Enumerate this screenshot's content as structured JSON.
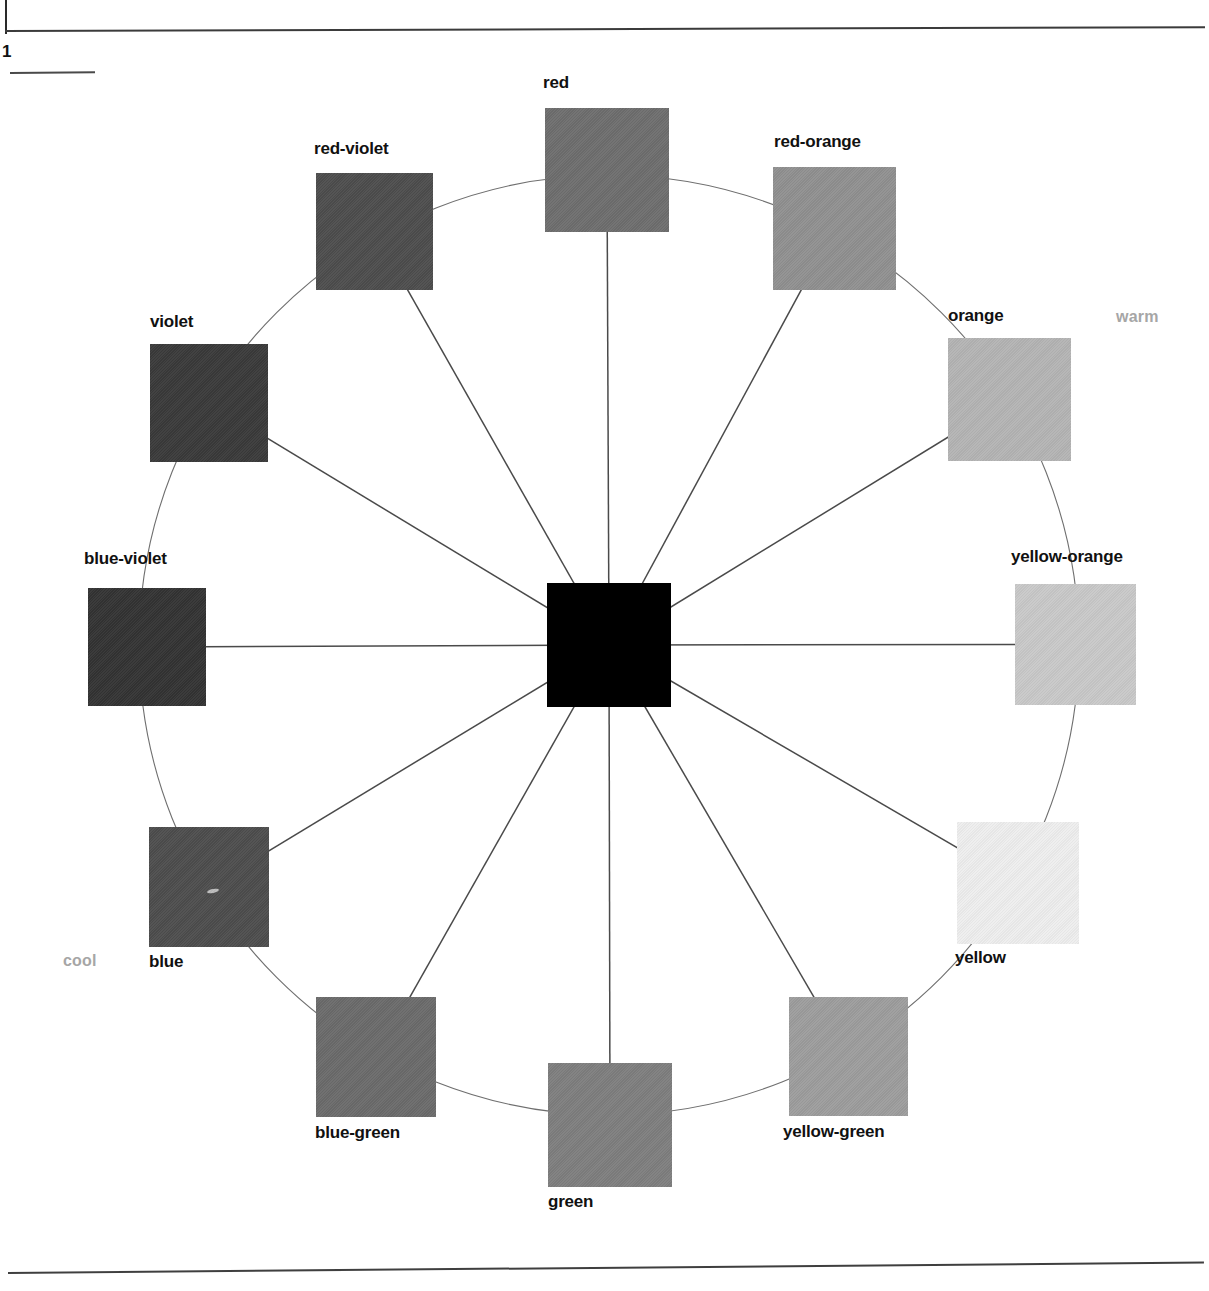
{
  "page": {
    "number": "1",
    "background": "#ffffff"
  },
  "figure": {
    "center": {
      "label": "center-square",
      "color": "#000000",
      "x": 547,
      "y": 583,
      "size": 124
    },
    "temperature_labels": [
      {
        "text": "warm",
        "color": "#a6a6a6",
        "x": 1116,
        "y": 308
      },
      {
        "text": "cool",
        "color": "#a6a6a6",
        "x": 63,
        "y": 952
      }
    ]
  },
  "chart_data": {
    "type": "pie",
    "xlabel": "",
    "ylabel": "",
    "categories": [
      "red",
      "red-orange",
      "orange",
      "yellow-orange",
      "yellow",
      "yellow-green",
      "green",
      "blue-green",
      "blue",
      "blue-violet",
      "violet",
      "red-violet"
    ],
    "values": [
      30,
      30,
      30,
      30,
      30,
      30,
      30,
      30,
      30,
      30,
      30,
      30
    ],
    "swatches": [
      {
        "name": "red",
        "color": "#6e6e6e",
        "angle_deg": 0,
        "x": 545,
        "y": 108,
        "size": 124,
        "label_x": 543,
        "label_y": 73,
        "label_align": "left"
      },
      {
        "name": "red-orange",
        "color": "#909090",
        "angle_deg": 30,
        "x": 773,
        "y": 167,
        "size": 123,
        "label_x": 774,
        "label_y": 132,
        "label_align": "left"
      },
      {
        "name": "orange",
        "color": "#b4b4b4",
        "angle_deg": 60,
        "x": 948,
        "y": 338,
        "size": 123,
        "label_x": 948,
        "label_y": 306,
        "label_align": "left"
      },
      {
        "name": "yellow-orange",
        "color": "#c9c9c9",
        "angle_deg": 90,
        "x": 1015,
        "y": 584,
        "size": 121,
        "label_x": 1011,
        "label_y": 547,
        "label_align": "left"
      },
      {
        "name": "yellow",
        "color": "#eeeeee",
        "angle_deg": 120,
        "x": 957,
        "y": 822,
        "size": 122,
        "label_x": 955,
        "label_y": 948,
        "label_align": "left"
      },
      {
        "name": "yellow-green",
        "color": "#9d9d9d",
        "angle_deg": 150,
        "x": 789,
        "y": 997,
        "size": 119,
        "label_x": 783,
        "label_y": 1122,
        "label_align": "left"
      },
      {
        "name": "green",
        "color": "#7e7e7e",
        "angle_deg": 180,
        "x": 548,
        "y": 1063,
        "size": 124,
        "label_x": 548,
        "label_y": 1192,
        "label_align": "left"
      },
      {
        "name": "blue-green",
        "color": "#6b6b6b",
        "angle_deg": 210,
        "x": 316,
        "y": 997,
        "size": 120,
        "label_x": 315,
        "label_y": 1123,
        "label_align": "left"
      },
      {
        "name": "blue",
        "color": "#4d4d4d",
        "angle_deg": 240,
        "x": 149,
        "y": 827,
        "size": 120,
        "label_x": 149,
        "label_y": 952,
        "label_align": "left"
      },
      {
        "name": "blue-violet",
        "color": "#333333",
        "angle_deg": 270,
        "x": 88,
        "y": 588,
        "size": 118,
        "label_x": 84,
        "label_y": 549,
        "label_align": "left"
      },
      {
        "name": "violet",
        "color": "#3a3a3a",
        "angle_deg": 300,
        "x": 150,
        "y": 344,
        "size": 118,
        "label_x": 150,
        "label_y": 312,
        "label_align": "left"
      },
      {
        "name": "red-violet",
        "color": "#4d4d4d",
        "angle_deg": 330,
        "x": 316,
        "y": 173,
        "size": 117,
        "label_x": 314,
        "label_y": 139,
        "label_align": "left"
      }
    ],
    "geometry": {
      "center_x": 609,
      "center_y": 645,
      "ring_radius": 470,
      "spokes": 12,
      "grid": false,
      "legend": "none"
    }
  }
}
